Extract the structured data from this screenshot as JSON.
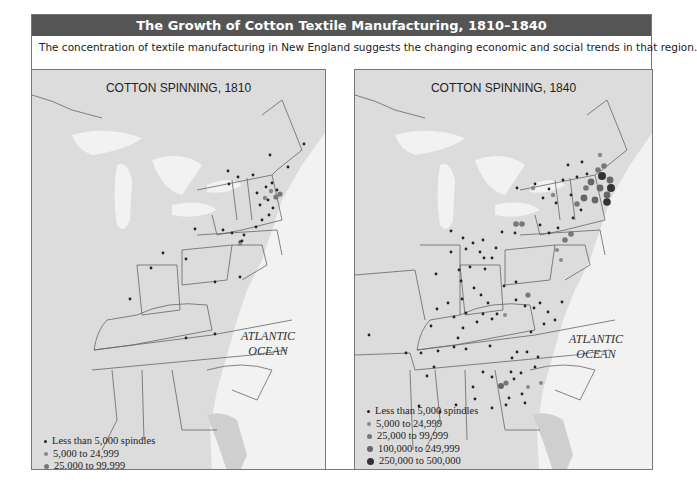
{
  "header": {
    "title": "The Growth of Cotton Textile Manufacturing, 1810–1840",
    "subtitle": "The concentration of textile manufacturing in New England suggests the changing economic and social trends in that region."
  },
  "maps": [
    {
      "title": "COTTON SPINNING, 1810",
      "ocean_label_1": "ATLANTIC",
      "ocean_label_2": "OCEAN",
      "legend": [
        {
          "label": "Less than 5,000 spindles",
          "size": 3,
          "color": "#222222"
        },
        {
          "label": "5,000 to 24,999",
          "size": 4,
          "color": "#888888"
        },
        {
          "label": "25,000 to 99,999",
          "size": 5,
          "color": "#777777"
        }
      ]
    },
    {
      "title": "COTTON SPINNING, 1840",
      "ocean_label_1": "ATLANTIC",
      "ocean_label_2": "OCEAN",
      "legend": [
        {
          "label": "Less than 5,000 spindles",
          "size": 3,
          "color": "#222222"
        },
        {
          "label": "5,000 to 24,999",
          "size": 4,
          "color": "#888888"
        },
        {
          "label": "25,000 to 99,999",
          "size": 5,
          "color": "#777777"
        },
        {
          "label": "100,000 to 249,999",
          "size": 6,
          "color": "#666666"
        },
        {
          "label": "250,000 to 500,000",
          "size": 7,
          "color": "#333333"
        }
      ]
    }
  ],
  "colors": {
    "title_bar": "#555555",
    "land": "#dcdcdc",
    "water": "#f2f2f2",
    "border": "#777777"
  }
}
